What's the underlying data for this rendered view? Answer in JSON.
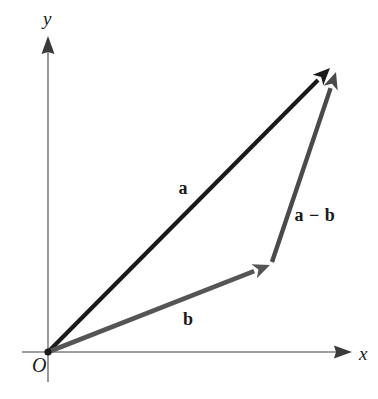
{
  "figure": {
    "width": 378,
    "height": 399,
    "background_color": "#ffffff"
  },
  "axes": {
    "origin_label": "O",
    "x_label": "x",
    "y_label": "y",
    "color": "#808080",
    "arrow_color": "#3a3a3a",
    "stroke_width": 1.6,
    "origin": {
      "x": 48,
      "y": 352
    },
    "x_axis": {
      "start_x": 22,
      "end_x": 352,
      "y": 352
    },
    "y_axis": {
      "x": 48,
      "start_y": 382,
      "end_y": 36
    },
    "ticks": [],
    "grid": false
  },
  "vectors": [
    {
      "id": "a",
      "label": "a",
      "color": "#1a1a1a",
      "stroke_width": 4.2,
      "tail": {
        "x": 48,
        "y": 352
      },
      "head": {
        "x": 330,
        "y": 68
      },
      "label_position": {
        "x": 183,
        "y": 188
      }
    },
    {
      "id": "b",
      "label": "b",
      "color": "#555555",
      "stroke_width": 4.6,
      "tail": {
        "x": 48,
        "y": 352
      },
      "head": {
        "x": 270,
        "y": 265
      },
      "label_position": {
        "x": 188,
        "y": 319
      }
    },
    {
      "id": "a-minus-b",
      "label": "a − b",
      "color": "#4a4a4a",
      "stroke_width": 4.4,
      "tail": {
        "x": 272,
        "y": 262
      },
      "head": {
        "x": 336,
        "y": 72
      },
      "label_position": {
        "x": 315,
        "y": 215
      }
    }
  ],
  "chart_data": {
    "type": "diagram",
    "xlabel": "x",
    "ylabel": "y",
    "grid": false,
    "legend": null,
    "annotations": [
      "a",
      "b",
      "a − b",
      "O"
    ],
    "series": [
      {
        "name": "a",
        "kind": "vector",
        "from": [
          0,
          0
        ],
        "to": [
          282,
          284
        ],
        "color": "#1a1a1a"
      },
      {
        "name": "b",
        "kind": "vector",
        "from": [
          0,
          0
        ],
        "to": [
          222,
          87
        ],
        "color": "#555555"
      },
      {
        "name": "a − b",
        "kind": "vector",
        "from": [
          224,
          90
        ],
        "to": [
          288,
          280
        ],
        "color": "#4a4a4a"
      }
    ]
  }
}
